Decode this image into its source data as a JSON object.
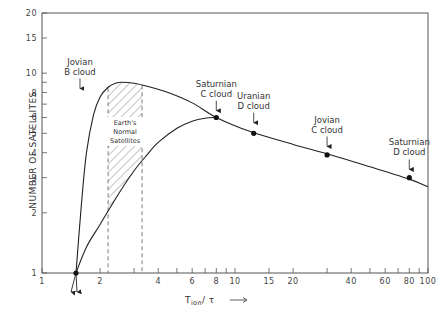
{
  "chart_data": {
    "type": "line",
    "title": "",
    "xlabel": "T_ion / τ →",
    "ylabel": "NUMBER OF SATELLITES",
    "xscale": "log",
    "yscale": "log",
    "xlim": [
      1,
      100
    ],
    "ylim": [
      1,
      20
    ],
    "grid": false,
    "x_ticks": [
      1,
      2,
      3,
      4,
      5,
      6,
      7,
      8,
      9,
      10,
      15,
      20,
      30,
      40,
      50,
      60,
      70,
      80,
      90,
      100
    ],
    "x_tick_labels": [
      "1",
      "2",
      "4",
      "6",
      "8",
      "10",
      "15",
      "20",
      "40",
      "60",
      "80",
      "100"
    ],
    "y_ticks": [
      1,
      2,
      3,
      4,
      5,
      6,
      7,
      8,
      9,
      10,
      15,
      20
    ],
    "y_tick_labels": [
      "1",
      "2",
      "3",
      "4",
      "5",
      "6",
      "8",
      "10",
      "15",
      "20"
    ],
    "series": [
      {
        "name": "upper envelope",
        "x": [
          1.5,
          1.6,
          1.7,
          1.85,
          2.0,
          2.2,
          2.4,
          2.6,
          3.0,
          3.5,
          4.5,
          6,
          8,
          12,
          20,
          30,
          50,
          80,
          100
        ],
        "y": [
          1.0,
          2.2,
          4.0,
          6.2,
          7.6,
          8.5,
          8.9,
          9.0,
          8.9,
          8.6,
          8.0,
          7.1,
          6.0,
          5.1,
          4.4,
          3.95,
          3.4,
          2.95,
          2.7
        ]
      },
      {
        "name": "lower curve",
        "x": [
          1.5,
          1.7,
          2.0,
          2.5,
          3.0,
          3.5,
          4.0,
          5.0,
          6.0,
          7.0,
          8.0
        ],
        "y": [
          1.0,
          1.35,
          1.75,
          2.5,
          3.25,
          3.9,
          4.5,
          5.3,
          5.75,
          5.95,
          6.0
        ]
      }
    ],
    "points": [
      {
        "label": "Jovian B cloud",
        "x": 1.5,
        "y": 1.0
      },
      {
        "label": "Saturnian C cloud",
        "x": 8.0,
        "y": 6.0
      },
      {
        "label": "Uranian D cloud",
        "x": 12.5,
        "y": 5.0
      },
      {
        "label": "Jovian C cloud",
        "x": 30,
        "y": 3.9
      },
      {
        "label": "Saturnian D cloud",
        "x": 80,
        "y": 3.0
      }
    ],
    "shaded_region": {
      "label": "Earth's Normal Satellites",
      "x_range": [
        2.2,
        3.3
      ]
    },
    "annotations": [
      {
        "text": [
          "Jovian",
          "B cloud"
        ],
        "x": 1.5,
        "arrow_to_y": 8.0
      },
      {
        "text": [
          "Saturnian",
          "C cloud"
        ],
        "x": 8.0,
        "arrow_to_y": 6.2
      },
      {
        "text": [
          "Uranian",
          "D cloud"
        ],
        "x": 12.5,
        "arrow_to_y": 5.4
      },
      {
        "text": [
          "Jovian",
          "C cloud"
        ],
        "x": 30,
        "arrow_to_y": 4.1
      },
      {
        "text": [
          "Saturnian",
          "D cloud"
        ],
        "x": 80,
        "arrow_to_y": 3.15
      }
    ]
  },
  "labels": {
    "ylabel": "NUMBER OF SATELLITES",
    "xlabel_main": "T",
    "xlabel_sub": "ion",
    "xlabel_rest": "/ τ",
    "hatch": [
      "Earth's",
      "Normal",
      "Satellites"
    ]
  }
}
